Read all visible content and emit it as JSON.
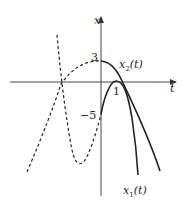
{
  "diagram": {
    "type": "function-plot",
    "axes": {
      "vertical_label": "x",
      "horizontal_label": "t"
    },
    "tick_labels": {
      "y_pos": "3",
      "y_neg": "−5",
      "t_pos": "1"
    },
    "curves": [
      {
        "name": "x2",
        "label_main": "x",
        "label_sub": "2",
        "label_paren": "(t)",
        "style": "solid",
        "description": "concave-down curve starting at 3, crossing t axis right of 1"
      },
      {
        "name": "x1",
        "label_main": "x",
        "label_sub": "1",
        "label_paren": "(t)",
        "style": "solid",
        "description": "curve starting at −5, peaking at t=1 touching axis, then descending steeply"
      }
    ],
    "dashed_extensions": [
      {
        "of": "x2",
        "description": "parabola continuation for t<0"
      },
      {
        "of": "x1",
        "description": "cubic-like continuation for t<0 with minimum"
      }
    ],
    "colors": {
      "line": "#222222",
      "axis": "#333333",
      "background": "#ffffff"
    }
  }
}
